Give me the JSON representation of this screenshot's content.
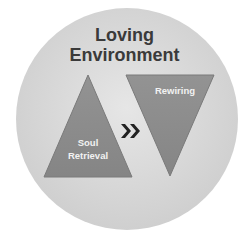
{
  "diagram": {
    "title_line1": "Loving",
    "title_line2": "Environment",
    "left_triangle": {
      "line1": "Soul",
      "line2": "Retrieval"
    },
    "right_triangle": {
      "label": "Rewiring"
    },
    "arrow": "chevron-double-right"
  },
  "colors": {
    "circle": "#d9d9d9",
    "triangle": "#8c8c8c",
    "text_light": "#f2f2f2",
    "title": "#3a3a3a"
  }
}
